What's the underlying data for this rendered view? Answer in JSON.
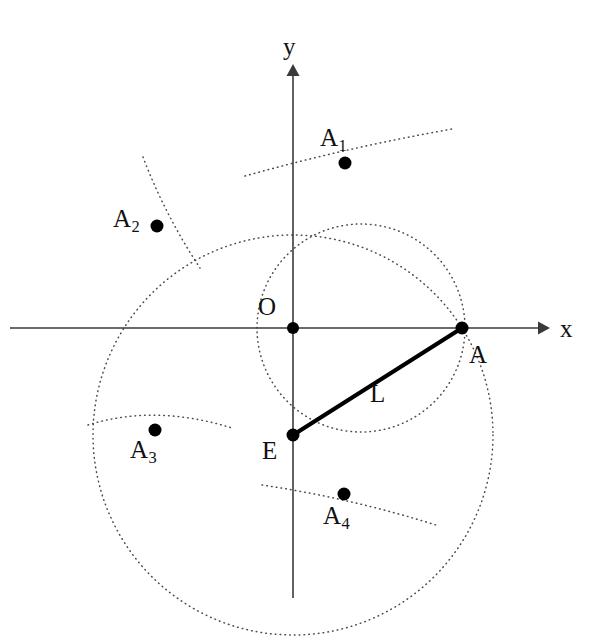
{
  "figure": {
    "width": 601,
    "height": 636,
    "background_color": "#ffffff",
    "ink_color": "#111111",
    "dotted_curve_color": "#4a4a4a",
    "axis_color": "#3a3a3a",
    "segment_color": "#000000"
  },
  "axes": {
    "x_label": "x",
    "y_label": "y",
    "origin_label": "O",
    "x_axis": {
      "x1": 10,
      "y1": 328,
      "x2": 543,
      "y2": 328
    },
    "y_axis": {
      "x1": 293,
      "y1": 70,
      "x2": 293,
      "y2": 598
    },
    "x_label_pos": {
      "x": 560,
      "y": 318
    },
    "y_label_pos": {
      "x": 283,
      "y": 34
    },
    "origin_label_pos": {
      "x": 258,
      "y": 295
    }
  },
  "points": [
    {
      "id": "O",
      "label": "O",
      "sub": "",
      "cx": 293,
      "cy": 328,
      "r": 6.0,
      "label_x": 258,
      "label_y": 295
    },
    {
      "id": "A",
      "label": "A",
      "sub": "",
      "cx": 462,
      "cy": 328,
      "r": 6.5,
      "label_x": 468,
      "label_y": 342
    },
    {
      "id": "E",
      "label": "E",
      "sub": "",
      "cx": 293,
      "cy": 435,
      "r": 6.5,
      "label_x": 262,
      "label_y": 438
    },
    {
      "id": "A1",
      "label": "A",
      "sub": "1",
      "cx": 345,
      "cy": 163,
      "r": 6.5,
      "label_x": 322,
      "label_y": 126
    },
    {
      "id": "A2",
      "label": "A",
      "sub": "2",
      "cx": 157,
      "cy": 226,
      "r": 6.5,
      "label_x": 115,
      "label_y": 207
    },
    {
      "id": "A3",
      "label": "A",
      "sub": "3",
      "cx": 155,
      "cy": 430,
      "r": 6.5,
      "label_x": 131,
      "label_y": 437
    },
    {
      "id": "A4",
      "label": "A",
      "sub": "4",
      "cx": 344,
      "cy": 494,
      "r": 6.5,
      "label_x": 324,
      "label_y": 503
    }
  ],
  "segments": [
    {
      "id": "EA",
      "label": "L",
      "from": "E",
      "to": "A",
      "x1": 293,
      "y1": 435,
      "x2": 462,
      "y2": 328,
      "label_x": 368,
      "label_y": 380
    }
  ],
  "circles": [
    {
      "id": "circle-E",
      "name": "circle-centered-at-E-radius-L",
      "cx": 293,
      "cy": 435,
      "r": 200,
      "style": "dotted",
      "passes_through": [
        "A",
        "A2",
        "A3",
        "A4"
      ]
    },
    {
      "id": "circle-O",
      "name": "circle-centered-near-origin",
      "cx": 361,
      "cy": 328,
      "r": 104,
      "style": "dotted",
      "passes_through": [
        "A",
        "A1",
        "A4"
      ]
    }
  ],
  "arcs": [
    {
      "id": "arc-A1",
      "name": "construction-arc-through-A1",
      "cx": 293,
      "cy": 435,
      "r": 288,
      "start_deg": -78,
      "end_deg": -40,
      "style": "dotted"
    },
    {
      "id": "arc-A2",
      "name": "construction-arc-through-A2",
      "cx": 293,
      "cy": 180,
      "r": 146,
      "start_deg": 168,
      "end_deg": 118,
      "style": "dotted"
    },
    {
      "id": "arc-A3",
      "name": "construction-arc-through-A3",
      "cx": 160,
      "cy": 300,
      "r": 132,
      "start_deg": 60,
      "end_deg": 118,
      "style": "dotted"
    },
    {
      "id": "arc-A4",
      "name": "construction-arc-through-A4",
      "cx": 293,
      "cy": 328,
      "r": 200,
      "start_deg": 56,
      "end_deg": 22,
      "style": "dotted"
    }
  ],
  "legend_notes": {
    "segment_label": "L",
    "description": "Segment L joins point E on the y-axis to point A on the x-axis."
  }
}
